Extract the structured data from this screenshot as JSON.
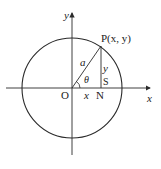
{
  "diagram": {
    "type": "unit-circle-polar-coordinates",
    "stroke_color": "#2a2a2a",
    "background": "#ffffff",
    "axes": {
      "x_label": "x",
      "y_label": "y"
    },
    "circle": {
      "radius_label": "a"
    },
    "points": {
      "origin": "O",
      "P": "P(x, y)",
      "N": "N",
      "S": "S"
    },
    "segments": {
      "horizontal_leg": "x",
      "vertical_leg": "y",
      "hypotenuse": "a"
    },
    "angle_label": "θ"
  }
}
